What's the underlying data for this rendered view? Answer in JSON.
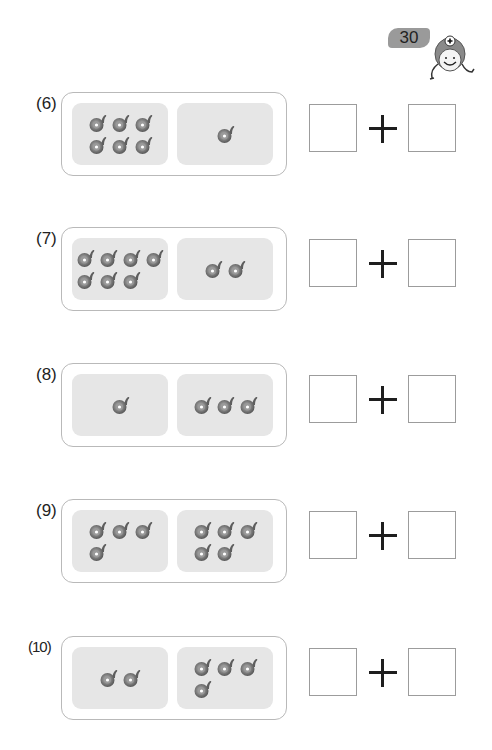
{
  "header": {
    "page_number": "30",
    "mascot_icon": "smiling-mascot-with-plus-sign"
  },
  "colors": {
    "badge_gray": "#9a9a9a",
    "pane_gray": "#e6e6e6",
    "frame_border": "#b9b9b9",
    "answer_border": "#9c9c9c",
    "counter_dark": "#6e6e6e"
  },
  "counter_icon": "snail-shaped-counter",
  "problems": [
    {
      "label": "(6)",
      "left_count": 6,
      "right_count": 1,
      "left_rows": [
        3,
        3
      ],
      "right_rows": [
        1
      ],
      "operator": "+",
      "answer_left": "",
      "answer_right": ""
    },
    {
      "label": "(7)",
      "left_count": 7,
      "right_count": 2,
      "left_rows": [
        4,
        3
      ],
      "right_rows": [
        2
      ],
      "operator": "+",
      "answer_left": "",
      "answer_right": ""
    },
    {
      "label": "(8)",
      "left_count": 1,
      "right_count": 3,
      "left_rows": [
        1
      ],
      "right_rows": [
        3
      ],
      "operator": "+",
      "answer_left": "",
      "answer_right": ""
    },
    {
      "label": "(9)",
      "left_count": 4,
      "right_count": 5,
      "left_rows": [
        3,
        1
      ],
      "right_rows": [
        3,
        2
      ],
      "operator": "+",
      "answer_left": "",
      "answer_right": ""
    },
    {
      "label": "(10)",
      "left_count": 2,
      "right_count": 4,
      "left_rows": [
        2
      ],
      "right_rows": [
        3,
        1
      ],
      "operator": "+",
      "answer_left": "",
      "answer_right": ""
    }
  ]
}
